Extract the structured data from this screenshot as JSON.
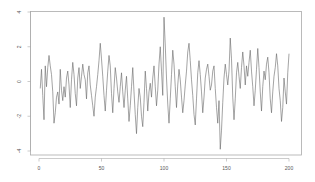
{
  "chart_data": {
    "type": "line",
    "title": "",
    "xlabel": "",
    "ylabel": "",
    "xlim": [
      0,
      200
    ],
    "ylim": [
      -4,
      4
    ],
    "grid": false,
    "legend": null,
    "x_ticks": [
      0,
      50,
      100,
      150,
      200
    ],
    "x_tick_labels": [
      "0",
      "50",
      "100",
      "150",
      "200"
    ],
    "y_ticks": [
      4,
      2,
      0,
      -2,
      -4
    ],
    "y_tick_labels": [
      "4",
      "2",
      "0",
      "-2",
      "-4"
    ],
    "line_color": "#666666",
    "series": [
      {
        "name": "series",
        "x_start": 1,
        "values": [
          -0.4,
          0.7,
          -0.8,
          -2.2,
          0.9,
          -0.3,
          0.8,
          1.5,
          0.9,
          0.4,
          -0.6,
          -2.4,
          -1.8,
          -0.9,
          -0.6,
          -1.3,
          0.7,
          -0.5,
          -1.1,
          -0.3,
          -0.9,
          0.2,
          0.6,
          -0.2,
          -1.5,
          0.1,
          1.1,
          0.4,
          -0.7,
          -1.4,
          0.2,
          0.8,
          -0.4,
          0.3,
          1.0,
          0.4,
          0.1,
          -1.0,
          0.5,
          0.9,
          -0.2,
          -0.8,
          -1.4,
          -2.0,
          -0.9,
          -0.3,
          0.4,
          1.2,
          2.2,
          1.3,
          0.3,
          -0.8,
          -1.7,
          -0.5,
          0.6,
          1.5,
          0.9,
          -0.7,
          -1.8,
          -0.4,
          0.8,
          0.2,
          -0.6,
          -1.2,
          -0.3,
          0.5,
          -0.6,
          -1.5,
          -0.5,
          0.3,
          -1.0,
          -2.3,
          -1.4,
          -0.3,
          0.8,
          -0.6,
          -1.9,
          -3.0,
          -1.5,
          -0.4,
          -0.9,
          -2.0,
          -2.6,
          -1.2,
          0.6,
          -0.4,
          -1.7,
          -0.6,
          -0.1,
          -0.9,
          0.2,
          0.9,
          -0.3,
          -1.4,
          -0.5,
          1.0,
          2.0,
          0.6,
          -0.8,
          3.7,
          2.1,
          0.2,
          -1.3,
          -2.4,
          -1.0,
          0.4,
          1.8,
          1.0,
          -0.3,
          -1.5,
          -0.2,
          0.7,
          0.1,
          -0.9,
          -1.8,
          -1.1,
          -0.2,
          0.6,
          1.7,
          2.2,
          1.2,
          0.1,
          -0.8,
          -1.9,
          -2.5,
          -1.0,
          0.5,
          1.2,
          0.4,
          -0.6,
          -1.8,
          -0.9,
          0.2,
          0.7,
          1.0,
          0.3,
          -0.5,
          -0.2,
          0.6,
          0.9,
          -0.4,
          -1.5,
          -2.4,
          -1.1,
          -3.9,
          -2.8,
          -1.2,
          0.2,
          1.0,
          0.4,
          -0.2,
          0.6,
          2.5,
          1.3,
          -0.9,
          -2.2,
          -1.0,
          0.5,
          1.1,
          0.3,
          -0.4,
          0.8,
          1.7,
          0.9,
          -0.2,
          0.9,
          0.3,
          1.1,
          1.8,
          0.6,
          -0.3,
          -1.4,
          -0.5,
          0.7,
          1.9,
          0.8,
          -0.6,
          -1.7,
          -0.3,
          0.6,
          0.1,
          1.0,
          1.4,
          0.5,
          -1.0,
          -1.8,
          -0.6,
          0.3,
          0.8,
          1.6,
          0.9,
          -0.4,
          -1.1,
          -2.3,
          -1.5,
          0.2,
          -0.6,
          -1.3,
          0.5,
          1.6
        ]
      }
    ]
  }
}
